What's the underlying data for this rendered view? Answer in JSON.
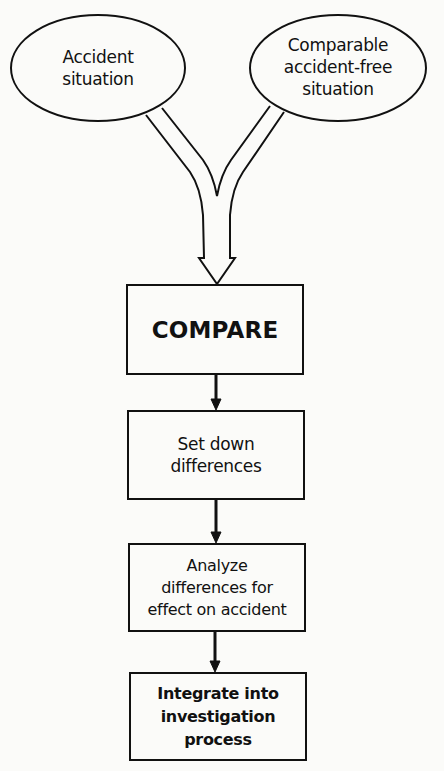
{
  "diagram": {
    "inputs": [
      {
        "id": "accident",
        "label_lines": [
          "Accident",
          "situation"
        ]
      },
      {
        "id": "comparable",
        "label_lines": [
          "Comparable",
          "accident-free",
          "situation"
        ]
      }
    ],
    "steps": [
      {
        "id": "compare",
        "label": "COMPARE"
      },
      {
        "id": "set-down",
        "label_lines": [
          "Set down",
          "differences"
        ]
      },
      {
        "id": "analyze",
        "label_lines": [
          "Analyze",
          "differences for",
          "effect on accident"
        ]
      },
      {
        "id": "integrate",
        "label_lines": [
          "Integrate into",
          "investigation",
          "process"
        ]
      }
    ],
    "edges": [
      {
        "from": "accident",
        "to": "compare",
        "style": "hollow-merge"
      },
      {
        "from": "comparable",
        "to": "compare",
        "style": "hollow-merge"
      },
      {
        "from": "compare",
        "to": "set-down"
      },
      {
        "from": "set-down",
        "to": "analyze"
      },
      {
        "from": "analyze",
        "to": "integrate"
      }
    ]
  }
}
